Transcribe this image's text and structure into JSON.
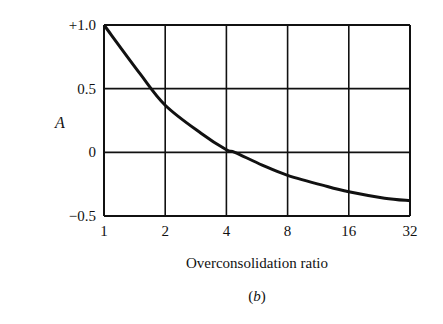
{
  "chart_data": {
    "type": "line",
    "title": "",
    "xlabel": "Overconsolidation ratio",
    "ylabel": "A",
    "caption_prefix": "(",
    "caption_letter": "b",
    "caption_suffix": ")",
    "x_scale": "log2",
    "x_ticks": [
      "1",
      "2",
      "4",
      "8",
      "16",
      "32"
    ],
    "x_tick_values": [
      1,
      2,
      4,
      8,
      16,
      32
    ],
    "y_ticks": [
      "+1.0",
      "0.5",
      "0",
      "−0.5"
    ],
    "y_tick_values": [
      1.0,
      0.5,
      0,
      -0.5
    ],
    "xlim": [
      1,
      32
    ],
    "ylim": [
      -0.5,
      1.0
    ],
    "grid": true,
    "legend": null,
    "series": [
      {
        "name": "A vs OCR",
        "x": [
          1,
          1.5,
          2,
          3,
          4,
          4.4,
          6,
          8,
          12,
          16,
          24,
          32
        ],
        "y": [
          1.0,
          0.62,
          0.37,
          0.15,
          0.02,
          0.0,
          -0.1,
          -0.18,
          -0.26,
          -0.31,
          -0.36,
          -0.38
        ]
      }
    ]
  }
}
